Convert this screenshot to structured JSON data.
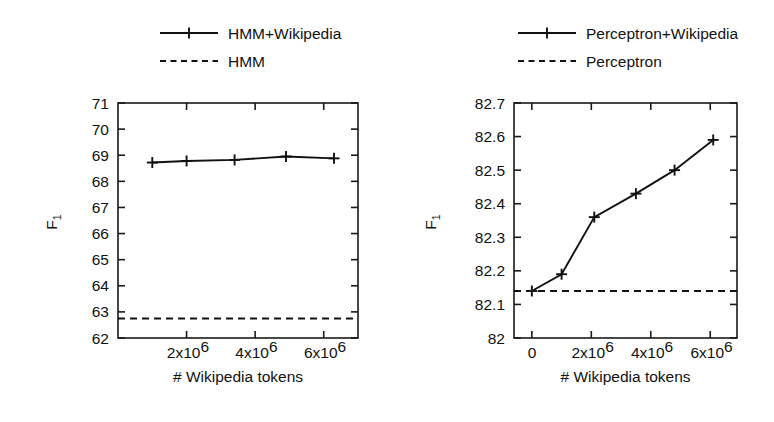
{
  "figure": {
    "background": "#ffffff",
    "ink_color": "#111111",
    "panel_count": 2
  },
  "chart_data": [
    {
      "id": "hmm-panel",
      "type": "line",
      "title": "",
      "xlabel": "# Wikipedia tokens",
      "ylabel": "F_1",
      "ylabel_display": "F",
      "ylabel_sub": "1",
      "xlim": [
        0,
        7000000
      ],
      "ylim": [
        62,
        71
      ],
      "grid": false,
      "legend_position": "above-center",
      "xticks": [
        2000000,
        4000000,
        6000000
      ],
      "xticklabels": [
        "2x10^6",
        "4x10^6",
        "6x10^6"
      ],
      "xtick_mantissas": [
        "2x10",
        "4x10",
        "6x10"
      ],
      "xtick_exponents": [
        "6",
        "6",
        "6"
      ],
      "yticks": [
        62,
        63,
        64,
        65,
        66,
        67,
        68,
        69,
        70,
        71
      ],
      "yticklabels": [
        "62",
        "63",
        "64",
        "65",
        "66",
        "67",
        "68",
        "69",
        "70",
        "71"
      ],
      "series": [
        {
          "name": "HMM+Wikipedia",
          "style": "solid",
          "marker": "plus",
          "x": [
            1000000,
            2000000,
            3400000,
            4900000,
            6300000
          ],
          "values": [
            68.72,
            68.78,
            68.82,
            68.95,
            68.88
          ]
        },
        {
          "name": "HMM",
          "style": "dashed",
          "marker": "none",
          "constant": 62.75
        }
      ]
    },
    {
      "id": "perceptron-panel",
      "type": "line",
      "title": "",
      "xlabel": "# Wikipedia tokens",
      "ylabel": "F_1",
      "ylabel_display": "F",
      "ylabel_sub": "1",
      "xlim": [
        -600000,
        6900000
      ],
      "ylim": [
        82.0,
        82.7
      ],
      "grid": false,
      "legend_position": "above-center",
      "xticks": [
        0,
        2000000,
        4000000,
        6000000
      ],
      "xticklabels": [
        "0",
        "2x10^6",
        "4x10^6",
        "6x10^6"
      ],
      "xtick_mantissas": [
        "0",
        "2x10",
        "4x10",
        "6x10"
      ],
      "xtick_exponents": [
        "",
        "6",
        "6",
        "6"
      ],
      "yticks": [
        82.0,
        82.1,
        82.2,
        82.3,
        82.4,
        82.5,
        82.6,
        82.7
      ],
      "yticklabels": [
        "82",
        "82.1",
        "82.2",
        "82.3",
        "82.4",
        "82.5",
        "82.6",
        "82.7"
      ],
      "series": [
        {
          "name": "Perceptron+Wikipedia",
          "style": "solid",
          "marker": "plus",
          "x": [
            0,
            1000000,
            2100000,
            3500000,
            4800000,
            6100000
          ],
          "values": [
            82.14,
            82.19,
            82.36,
            82.43,
            82.5,
            82.59
          ]
        },
        {
          "name": "Perceptron",
          "style": "dashed",
          "marker": "none",
          "constant": 82.14
        }
      ]
    }
  ]
}
